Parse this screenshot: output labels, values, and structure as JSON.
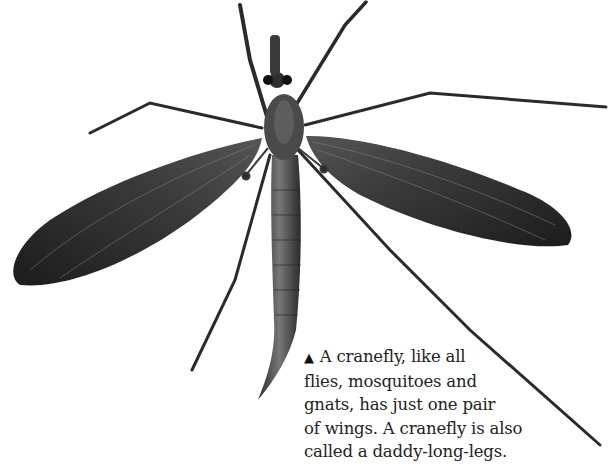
{
  "figure": {
    "background_color": "#ffffff",
    "insect_color": "#2a2a2a"
  },
  "caption": {
    "marker_icon": "black-up-triangle",
    "marker": "▲",
    "lines": [
      "A cranefly, like all",
      "flies, mosquitoes and",
      "gnats, has just one pair",
      "of wings. A cranefly is also",
      "called a daddy-long-legs."
    ]
  }
}
